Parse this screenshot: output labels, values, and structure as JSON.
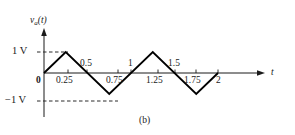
{
  "figure": {
    "caption": "(b)",
    "y_axis_label_main": "v",
    "y_axis_label_sub": "a",
    "y_axis_label_arg": "(t)",
    "x_axis_label": "t",
    "origin_label": "0",
    "y_ticks": [
      {
        "label": "1 V",
        "value": 1
      },
      {
        "label": "−1 V",
        "value": -1
      }
    ],
    "x_ticks_above": [
      {
        "label": "0.5",
        "value": 0.5
      },
      {
        "label": "1",
        "value": 1
      },
      {
        "label": "1.5",
        "value": 1.5
      }
    ],
    "x_ticks_below": [
      {
        "label": "0.25",
        "value": 0.25
      },
      {
        "label": "0.75",
        "value": 0.75
      },
      {
        "label": "1.25",
        "value": 1.25
      },
      {
        "label": "1.75",
        "value": 1.75
      },
      {
        "label": "2",
        "value": 2
      }
    ],
    "colors": {
      "ink": "#1a1a1a",
      "waveform": "#000000",
      "dashed": "#333333",
      "background": "#ffffff"
    }
  },
  "chart_data": {
    "type": "line",
    "title": "",
    "subtitle": "(b)",
    "xlabel": "t",
    "ylabel": "v_a(t)",
    "xlim": [
      0,
      2.15
    ],
    "ylim": [
      -1.35,
      1.35
    ],
    "grid": false,
    "legend": null,
    "waveform": "triangular",
    "period": 1,
    "amplitude": 1,
    "units": {
      "x": "s",
      "y": "V"
    },
    "x": [
      0,
      0.25,
      0.75,
      1.25,
      1.75,
      2
    ],
    "y": [
      0,
      1,
      -1,
      1,
      -1,
      0
    ],
    "series": [
      {
        "name": "v_a(t)",
        "points": [
          {
            "t": 0,
            "v": 0
          },
          {
            "t": 0.25,
            "v": 1
          },
          {
            "t": 0.75,
            "v": -1
          },
          {
            "t": 1.25,
            "v": 1
          },
          {
            "t": 1.75,
            "v": -1
          },
          {
            "t": 2,
            "v": 0
          }
        ]
      }
    ],
    "reference_lines": [
      {
        "axis": "y",
        "value": 1,
        "style": "dashed",
        "label": "1 V"
      },
      {
        "axis": "y",
        "value": -1,
        "style": "dashed",
        "label": "−1 V"
      }
    ],
    "xticks": [
      0,
      0.25,
      0.5,
      0.75,
      1,
      1.25,
      1.5,
      1.75,
      2
    ],
    "xticklabels": [
      "0",
      "0.25",
      "0.5",
      "0.75",
      "1",
      "1.25",
      "1.5",
      "1.75",
      "2"
    ],
    "yticks": [
      -1,
      1
    ],
    "yticklabels": [
      "−1 V",
      "1 V"
    ]
  }
}
